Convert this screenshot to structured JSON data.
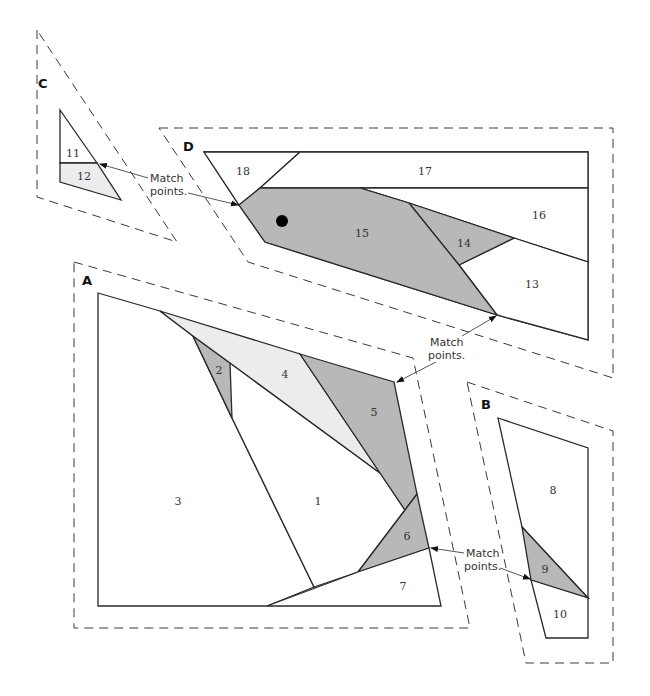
{
  "sections": {
    "A": {
      "label": "A",
      "pieces": [
        "1",
        "2",
        "3",
        "4",
        "5",
        "6",
        "7"
      ]
    },
    "B": {
      "label": "B",
      "pieces": [
        "8",
        "9",
        "10"
      ]
    },
    "C": {
      "label": "C",
      "pieces": [
        "11",
        "12"
      ]
    },
    "D": {
      "label": "D",
      "pieces": [
        "13",
        "14",
        "15",
        "16",
        "17",
        "18"
      ]
    }
  },
  "annotations": {
    "match_cd": [
      "Match",
      "points."
    ],
    "match_ad": [
      "Match",
      "points."
    ],
    "match_ab": [
      "Match",
      "points."
    ]
  },
  "colors": {
    "dark_fabric": "#b8b8b8",
    "light_fabric": "#ececec",
    "white_fabric": "#ffffff"
  }
}
